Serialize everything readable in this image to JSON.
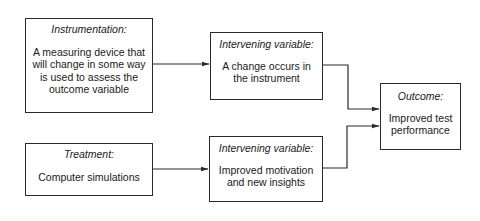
{
  "diagram": {
    "type": "flowchart",
    "nodes": {
      "instrumentation": {
        "title": "Instrumentation:",
        "lines": [
          "A measuring device that",
          "will change in some way",
          "is used to assess the",
          "outcome variable"
        ]
      },
      "treatment": {
        "title": "Treatment:",
        "lines": [
          "Computer simulations"
        ]
      },
      "intervening_1": {
        "title": "Intervening variable:",
        "lines": [
          "A change occurs in",
          "the instrument"
        ]
      },
      "intervening_2": {
        "title": "Intervening variable:",
        "lines": [
          "Improved motivation",
          "and new insights"
        ]
      },
      "outcome": {
        "title": "Outcome:",
        "lines": [
          "Improved test",
          "performance"
        ]
      }
    },
    "edges": [
      {
        "from": "instrumentation",
        "to": "intervening_1"
      },
      {
        "from": "treatment",
        "to": "intervening_2"
      },
      {
        "from": "intervening_1",
        "to": "outcome"
      },
      {
        "from": "intervening_2",
        "to": "outcome"
      }
    ],
    "colors": {
      "line": "#2a2a2a",
      "background": "#ffffff",
      "text": "#1a1a1a"
    }
  }
}
